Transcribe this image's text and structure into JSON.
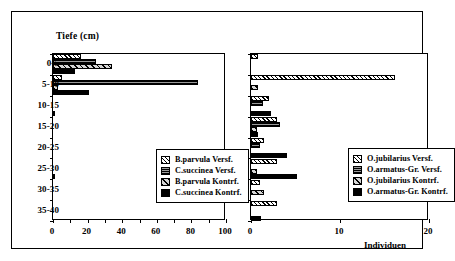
{
  "figure": {
    "axis_title_y": "Tiefe (cm)",
    "axis_caption_x": "Individuen"
  },
  "chart_data": [
    {
      "type": "bar",
      "orientation": "horizontal",
      "panel": "left",
      "title": "",
      "xlabel": "",
      "ylabel": "Tiefe (cm)",
      "categories": [
        "0-5",
        "5-10",
        "10-15",
        "15-20",
        "20-25",
        "25-30",
        "30-35",
        "35-40"
      ],
      "xlim": [
        0,
        100
      ],
      "xticks": [
        0,
        10,
        20,
        30,
        40,
        50,
        60,
        70,
        80,
        90,
        100
      ],
      "xticklabels": [
        "0",
        "20",
        "40",
        "60",
        "80",
        "100"
      ],
      "xticklabel_values": [
        0,
        20,
        40,
        60,
        80,
        100
      ],
      "grid": false,
      "legend_position": "center-right",
      "series": [
        {
          "name": "B.parvula Versf.",
          "fill": "white-hatch",
          "values": [
            16,
            5,
            0,
            0,
            0,
            0,
            0,
            0
          ]
        },
        {
          "name": "C.succinea Versf.",
          "fill": "dark-checker",
          "values": [
            25,
            84,
            0,
            0,
            0,
            0,
            0,
            0
          ]
        },
        {
          "name": "B.parvula Kontrf.",
          "fill": "grey-hatch",
          "values": [
            34,
            3,
            0,
            0,
            0,
            0,
            0,
            0
          ]
        },
        {
          "name": "C.succinea Kontrf.",
          "fill": "solid-black",
          "values": [
            13,
            21,
            0.6,
            0,
            0,
            0.6,
            0,
            0
          ]
        }
      ]
    },
    {
      "type": "bar",
      "orientation": "horizontal",
      "panel": "right",
      "title": "",
      "xlabel": "Individuen",
      "ylabel": "Tiefe (cm)",
      "categories": [
        "0-5",
        "5-10",
        "10-15",
        "15-20",
        "20-25",
        "25-30",
        "30-35",
        "35-40"
      ],
      "xlim": [
        0,
        20
      ],
      "xticks": [
        0,
        10,
        20
      ],
      "xticklabels": [
        "0",
        "10",
        "20"
      ],
      "xticklabel_values": [
        0,
        10,
        20
      ],
      "grid": false,
      "legend_position": "center-right",
      "series": [
        {
          "name": "O.jubilarius Versf.",
          "fill": "white-hatch",
          "values": [
            0.8,
            16.2,
            2.0,
            2.9,
            1.5,
            2.9,
            1.0,
            2.9
          ]
        },
        {
          "name": "O.armatus-Gr. Versf.",
          "fill": "dark-checker",
          "values": [
            0,
            0,
            1.4,
            3.3,
            1.0,
            0,
            0,
            0
          ]
        },
        {
          "name": "O.jubilarius Kontrf.",
          "fill": "grey-hatch",
          "values": [
            0,
            0.8,
            0,
            0.7,
            0,
            0.7,
            1.5,
            0
          ]
        },
        {
          "name": "O.armatus-Gr. Kontrf.",
          "fill": "solid-black",
          "values": [
            0,
            0,
            2.2,
            0.8,
            4.0,
            5.2,
            0,
            1.1
          ]
        }
      ]
    }
  ]
}
